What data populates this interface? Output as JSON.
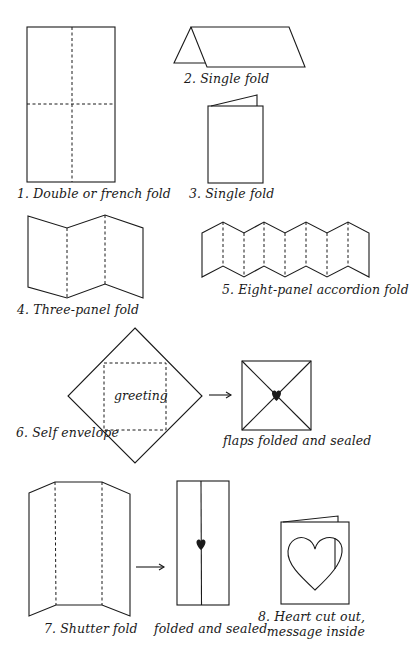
{
  "diagram": {
    "ink_color": "#1a1a1a",
    "background": "#ffffff",
    "figures": [
      {
        "id": 1,
        "label": "1. Double or french fold"
      },
      {
        "id": 2,
        "label": "2. Single fold"
      },
      {
        "id": 3,
        "label": "3. Single fold"
      },
      {
        "id": 4,
        "label": "4. Three-panel fold"
      },
      {
        "id": 5,
        "label": "5. Eight-panel accordion fold"
      },
      {
        "id": 6,
        "label": "6. Self envelope",
        "inner_text": "greeting",
        "result_label": "flaps folded and sealed"
      },
      {
        "id": 7,
        "label": "7. Shutter fold",
        "result_label": "folded and sealed"
      },
      {
        "id": 8,
        "label_line1": "8. Heart cut out,",
        "label_line2": "message inside"
      }
    ]
  }
}
